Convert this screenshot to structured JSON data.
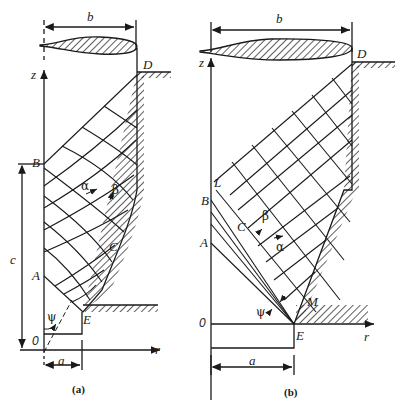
{
  "figures": [
    {
      "id": "a",
      "caption": "(a)",
      "labels": {
        "width_dim": "b",
        "axis_z": "z",
        "axis_r": "r",
        "origin": "0",
        "point_D": "D",
        "point_B": "B",
        "point_A": "A",
        "point_C": "C",
        "point_E": "E",
        "height_dim": "c",
        "base_dim": "a",
        "alpha_line": "α",
        "beta_line": "β",
        "angle_psi": "ψ"
      }
    },
    {
      "id": "b",
      "caption": "(b)",
      "labels": {
        "width_dim": "b",
        "axis_z": "z",
        "axis_r": "r",
        "origin": "0",
        "point_D": "D",
        "point_L": "L",
        "point_B": "B",
        "point_A": "A",
        "point_C": "C",
        "point_M": "M",
        "point_E": "E",
        "base_dim": "a",
        "alpha_line": "α",
        "beta_line": "β",
        "angle_psi": "ψ"
      }
    }
  ],
  "colors": {
    "ink": "#1a1a1a",
    "paper": "#ffffff"
  }
}
